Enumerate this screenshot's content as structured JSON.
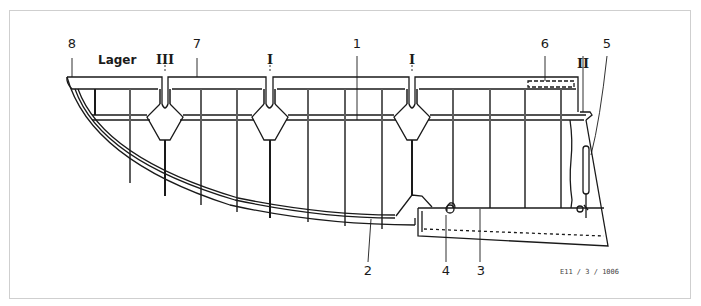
{
  "diagram": {
    "type": "technical-drawing",
    "reference_code": "E11 / 3 / 1006",
    "labels": {
      "n1": "1",
      "n2": "2",
      "n3": "3",
      "n4": "4",
      "n5": "5",
      "n6": "6",
      "n7": "7",
      "n8": "8",
      "bearing_word": "Lager",
      "bearing_III": "III",
      "bearing_I_a": "I",
      "bearing_I_b": "I",
      "bearing_II": "II"
    },
    "colors": {
      "line": "#1a1a1a",
      "frame": "#cfcfcf",
      "background": "#ffffff"
    }
  }
}
